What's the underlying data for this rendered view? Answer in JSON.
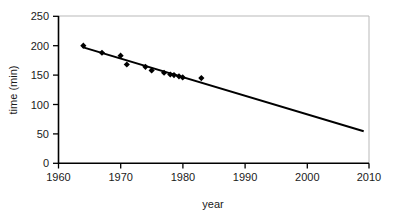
{
  "chart_data": {
    "type": "scatter",
    "title": "",
    "subtitle": "",
    "xlabel": "year",
    "ylabel": "time (min)",
    "xlim": [
      1960,
      2010
    ],
    "ylim": [
      0,
      250
    ],
    "xticks": [
      1960,
      1970,
      1980,
      1990,
      2000,
      2010
    ],
    "yticks": [
      0,
      50,
      100,
      150,
      200,
      250
    ],
    "xtick_labels": [
      "1960",
      "1970",
      "1980",
      "1990",
      "2000",
      "2010"
    ],
    "ytick_labels": [
      "0",
      "50",
      "100",
      "150",
      "200",
      "250"
    ],
    "grid": false,
    "legend": null,
    "legend_position": "none",
    "annotations": [],
    "series": [
      {
        "name": "records",
        "type": "scatter",
        "marker": "diamond",
        "color": "#000000",
        "points": [
          {
            "x": 1964,
            "y": 200
          },
          {
            "x": 1967,
            "y": 188
          },
          {
            "x": 1970,
            "y": 183
          },
          {
            "x": 1971,
            "y": 168
          },
          {
            "x": 1974,
            "y": 164
          },
          {
            "x": 1975,
            "y": 158
          },
          {
            "x": 1977,
            "y": 154
          },
          {
            "x": 1978,
            "y": 151
          },
          {
            "x": 1978.6,
            "y": 150
          },
          {
            "x": 1979.4,
            "y": 148
          },
          {
            "x": 1980,
            "y": 146
          },
          {
            "x": 1983,
            "y": 145
          }
        ]
      },
      {
        "name": "linear trend",
        "type": "line",
        "color": "#000000",
        "endpoints": [
          {
            "x": 1964,
            "y": 197
          },
          {
            "x": 2009,
            "y": 55
          }
        ]
      }
    ]
  },
  "axes": {
    "x_title": "year",
    "y_title": "time (min)"
  }
}
